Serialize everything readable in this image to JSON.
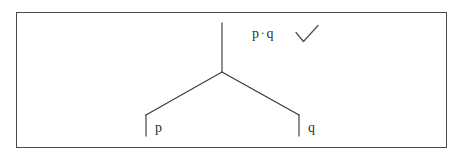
{
  "figure": {
    "background_color": "#ffffff",
    "stroke_color": "#3a3a3a",
    "frame_color": "#4a4a4a",
    "text_color": "#2f2f2f"
  },
  "frame": {
    "label": "figure-border"
  },
  "tree": {
    "name": "binary-tree",
    "root_stem": {
      "name": "root-stem",
      "x1": 222,
      "y1": 23,
      "x2": 222,
      "y2": 72
    },
    "apex": {
      "x": 222,
      "y": 72
    },
    "branches": [
      {
        "name": "left-branch",
        "x1": 222,
        "y1": 72,
        "x2": 146,
        "y2": 115
      },
      {
        "name": "right-branch",
        "x1": 222,
        "y1": 72,
        "x2": 299,
        "y2": 115
      }
    ],
    "leaves": [
      {
        "name": "leaf-p",
        "label": "p",
        "tick": {
          "x1": 146,
          "y1": 115,
          "x2": 146,
          "y2": 136
        },
        "label_x": 155,
        "label_y": 121
      },
      {
        "name": "leaf-q",
        "label": "q",
        "tick": {
          "x1": 299,
          "y1": 115,
          "x2": 299,
          "y2": 136
        },
        "label_x": 308,
        "label_y": 121
      }
    ]
  },
  "annotation": {
    "formula_left": "p",
    "formula_operator": "·",
    "formula_right": "q",
    "formula_full": "p · q",
    "check_mark": "✓",
    "check_mark_name": "check-icon"
  }
}
